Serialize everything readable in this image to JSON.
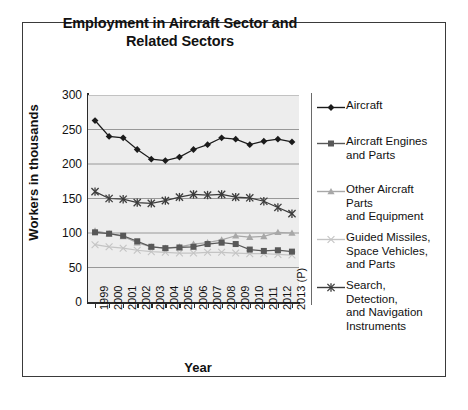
{
  "chart_data": {
    "type": "line",
    "title": "Employment in Aircraft Sector and Related Sectors",
    "xlabel": "Year",
    "ylabel": "Workers in thousands",
    "ylim": [
      0,
      300
    ],
    "ytick_step": 50,
    "yticks": [
      "300",
      "250",
      "200",
      "150",
      "100",
      "50",
      "0"
    ],
    "grid": true,
    "legend_position": "right",
    "plot_background": "#ededed",
    "categories": [
      "1999",
      "2000",
      "2001",
      "2002",
      "2003",
      "2004",
      "2005",
      "2006",
      "2007",
      "2008",
      "2009",
      "2010",
      "2011",
      "2012",
      "2013 (P)"
    ],
    "series": [
      {
        "name": "Aircraft",
        "marker": "diamond",
        "color": "#1b1b1b",
        "values": [
          263,
          240,
          238,
          221,
          207,
          205,
          210,
          221,
          228,
          238,
          236,
          228,
          233,
          236,
          232
        ]
      },
      {
        "name": "Aircraft Engines and Parts",
        "marker": "square",
        "color": "#585858",
        "values": [
          101,
          99,
          96,
          88,
          80,
          78,
          79,
          80,
          84,
          86,
          84,
          76,
          74,
          75,
          73
        ]
      },
      {
        "name": "Other Aircraft Parts and Equipment",
        "marker": "triangle",
        "color": "#a8a8a8",
        "values": [
          103,
          99,
          95,
          86,
          80,
          78,
          80,
          84,
          86,
          90,
          96,
          94,
          95,
          101,
          100
        ]
      },
      {
        "name": "Guided Missiles, Space Vehicles, and Parts",
        "marker": "x-thin",
        "color": "#c4c4c4",
        "values": [
          83,
          80,
          78,
          75,
          73,
          72,
          71,
          71,
          72,
          72,
          71,
          70,
          70,
          69,
          68
        ]
      },
      {
        "name": "Search, Detection, and Navigation Instruments",
        "marker": "asterisk",
        "color": "#3c3c3c",
        "values": [
          160,
          150,
          149,
          144,
          143,
          147,
          152,
          156,
          155,
          156,
          152,
          151,
          146,
          137,
          128
        ]
      }
    ]
  },
  "legend": {
    "items": [
      {
        "label": "Aircraft"
      },
      {
        "label": "Aircraft Engines\nand Parts"
      },
      {
        "label": "Other Aircraft Parts\nand Equipment"
      },
      {
        "label": "Guided Missiles,\nSpace Vehicles,\nand Parts"
      },
      {
        "label": "Search, Detection,\nand Navigation\nInstruments"
      }
    ]
  }
}
